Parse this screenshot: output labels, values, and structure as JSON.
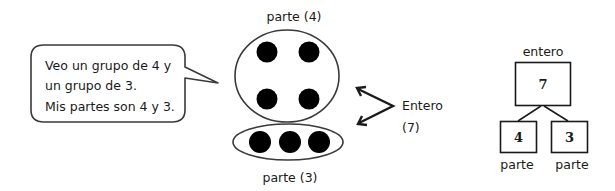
{
  "speech_bubble": {
    "lines": [
      "Veo un grupo de 4 y",
      "un grupo de 3.",
      "Mis partes son 4 y 3."
    ]
  },
  "groups_diagram": {
    "top_label": "parte (4)",
    "bottom_label": "parte (3)",
    "top_group_dots": 4,
    "bottom_group_dots": 3,
    "whole_label": "Entero",
    "whole_value": "(7)"
  },
  "number_bond": {
    "whole_label": "entero",
    "whole_value": "7",
    "parts": [
      {
        "value": "4",
        "label": "parte"
      },
      {
        "value": "3",
        "label": "parte"
      }
    ]
  },
  "colors": {
    "stroke": "#3a3a3a",
    "dot": "#000000",
    "background": "#ffffff"
  }
}
